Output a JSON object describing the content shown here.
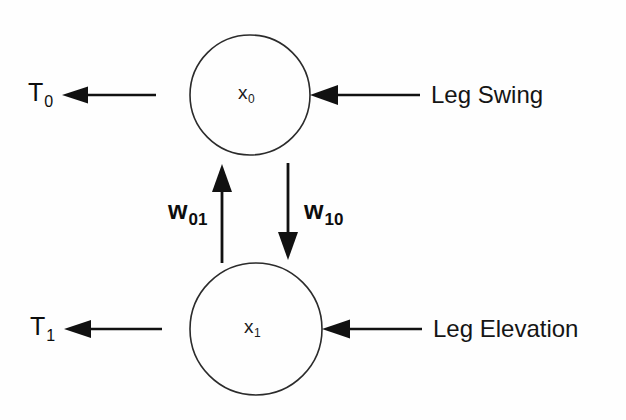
{
  "diagram": {
    "type": "neural-network-recurrent-two-neuron",
    "background_color": "#fefefe",
    "stroke_color": "#1a1a1a",
    "nodes": [
      {
        "id": "x0",
        "label_main": "x",
        "label_sub": "0",
        "cx": 250,
        "cy": 95,
        "r": 60
      },
      {
        "id": "x1",
        "label_main": "x",
        "label_sub": "1",
        "cx": 256,
        "cy": 329,
        "r": 66
      }
    ],
    "outputs": [
      {
        "id": "T0",
        "label_main": "T",
        "label_sub": "0",
        "from_node": "x0"
      },
      {
        "id": "T1",
        "label_main": "T",
        "label_sub": "1",
        "from_node": "x1"
      }
    ],
    "inputs": [
      {
        "id": "leg-swing",
        "label": "Leg Swing",
        "to_node": "x0"
      },
      {
        "id": "leg-elevation",
        "label": "Leg Elevation",
        "to_node": "x1"
      }
    ],
    "weights": [
      {
        "id": "w01",
        "label_main": "w",
        "label_sub": "01",
        "direction": "up",
        "from_node": "x1",
        "to_node": "x0"
      },
      {
        "id": "w10",
        "label_main": "w",
        "label_sub": "10",
        "direction": "down",
        "from_node": "x0",
        "to_node": "x1"
      }
    ]
  }
}
